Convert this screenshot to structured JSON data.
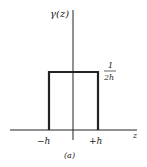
{
  "figure": {
    "y_label": "γ(z)",
    "x_label": "z",
    "height_numerator": "1",
    "height_denominator": "2h",
    "left_tick": "−h",
    "right_tick": "+h",
    "caption": "(a)"
  },
  "shape": {
    "type": "rectangular pulse",
    "x_range": [
      "-h",
      "+h"
    ],
    "height": "1/2h"
  },
  "colors": {
    "ink": "#222222",
    "background": "#ffffff"
  }
}
